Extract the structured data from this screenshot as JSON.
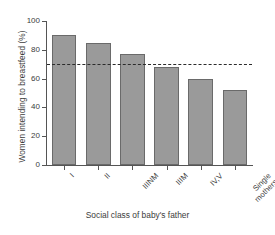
{
  "chart_data": {
    "type": "bar",
    "title": "",
    "xlabel": "Social class of baby's father",
    "ylabel": "Women intending to breastfeed (%)",
    "categories": [
      "I",
      "II",
      "IIINM",
      "IIIM",
      "IV,V",
      "Single\nmothers"
    ],
    "values": [
      90,
      85,
      77,
      68,
      60,
      52
    ],
    "ylim": [
      0,
      100
    ],
    "yticks": [
      0,
      20,
      40,
      60,
      80,
      100
    ],
    "ytick_labels": [
      "0",
      "20",
      "40",
      "60",
      "80",
      "100"
    ],
    "grid": false,
    "legend": "none",
    "annotations": [
      {
        "name": "reference-line",
        "type": "hline",
        "value": 70,
        "style": "dashed",
        "color": "#2b2b2b"
      }
    ],
    "series": [
      {
        "name": "Women intending to breastfeed",
        "values": [
          90,
          85,
          77,
          68,
          60,
          52
        ],
        "bar_color": "#9a9a9a",
        "bar_edge_color": "#6a6a6a"
      }
    ]
  },
  "colors": {
    "bar_fill": "#9a9a9a",
    "bar_edge": "#6a6a6a",
    "axis": "#555555",
    "text": "#3c3c3c",
    "reference_line": "#2b2b2b",
    "background": "#ffffff"
  }
}
